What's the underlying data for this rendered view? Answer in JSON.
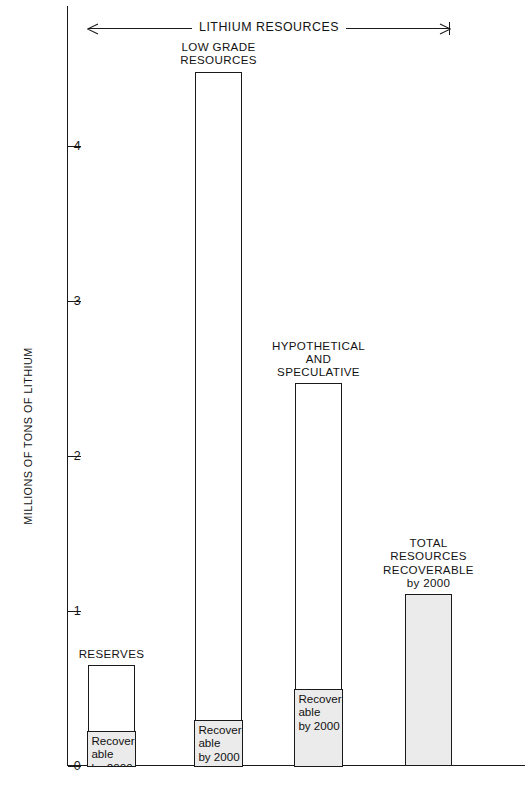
{
  "figure": {
    "bracket_label": "LITHIUM RESOURCES",
    "y_axis_title": "MILLIONS OF TONS OF LITHIUM"
  },
  "chart_data": {
    "type": "bar",
    "title": "LITHIUM RESOURCES",
    "xlabel": "",
    "ylabel": "MILLIONS OF TONS OF LITHIUM",
    "ylim": [
      0,
      4.7
    ],
    "yticks": [
      0,
      1,
      2,
      3,
      4
    ],
    "ytick_labels": [
      "0",
      "1",
      "2",
      "3",
      "4"
    ],
    "grid": false,
    "legend": "none",
    "units": "millions of tons of lithium",
    "categories": [
      "RESERVES",
      "LOW GRADE RESOURCES",
      "HYPOTHETICAL AND SPECULATIVE",
      "TOTAL RESOURCES RECOVERABLE by 2000"
    ],
    "series": [
      {
        "name": "Total",
        "values": [
          0.65,
          4.48,
          2.47,
          1.11
        ]
      },
      {
        "name": "Recoverable by 2000",
        "values": [
          0.23,
          0.3,
          0.5,
          1.11
        ]
      }
    ],
    "bars": [
      {
        "label": "RESERVES",
        "label_lines": [
          "RESERVES"
        ],
        "total": 0.65,
        "recoverable": 0.23,
        "shaded_label_lines": [
          "Recover-",
          "able",
          "by 2000"
        ],
        "fully_shaded": false
      },
      {
        "label": "LOW GRADE RESOURCES",
        "label_lines": [
          "LOW GRADE",
          "RESOURCES"
        ],
        "total": 4.48,
        "recoverable": 0.3,
        "shaded_label_lines": [
          "Recover-",
          "able",
          "by 2000"
        ],
        "fully_shaded": false
      },
      {
        "label": "HYPOTHETICAL AND SPECULATIVE",
        "label_lines": [
          "HYPOTHETICAL",
          "AND",
          "SPECULATIVE"
        ],
        "total": 2.47,
        "recoverable": 0.5,
        "shaded_label_lines": [
          "Recover-",
          "able",
          "by 2000"
        ],
        "fully_shaded": false
      },
      {
        "label": "TOTAL RESOURCES RECOVERABLE by 2000",
        "label_lines": [
          "TOTAL",
          "RESOURCES",
          "RECOVERABLE",
          "by 2000"
        ],
        "total": 1.11,
        "recoverable": 1.11,
        "shaded_label_lines": [],
        "fully_shaded": true
      }
    ],
    "colors": {
      "line": "#1a1a1a",
      "bar_fill_open": "#ffffff",
      "bar_fill_shaded": "#ebebeb",
      "background": "#ffffff"
    }
  }
}
